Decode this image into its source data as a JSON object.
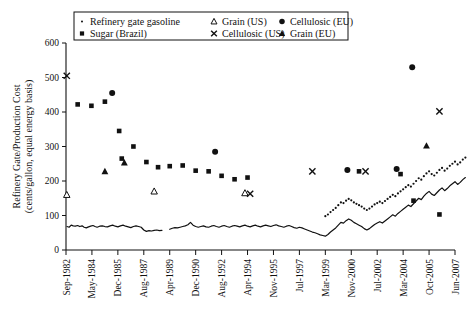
{
  "chart_data": {
    "type": "scatter",
    "title": "",
    "xlabel": "",
    "ylabel": "Refinery Gate/Production Cost (cents/gallon, equal energy basis)",
    "ylabel_line1": "Refinery Gate/Production Cost",
    "ylabel_line2": "(cents/gallon, equal energy basis)",
    "ylim": [
      0,
      600
    ],
    "yticks": [
      0,
      100,
      200,
      300,
      400,
      500,
      600
    ],
    "grid": false,
    "legend_position": "top-center",
    "xticks": [
      "Sep-1982",
      "May-1984",
      "Dec-1985",
      "Aug-1987",
      "Apr-1989",
      "Dec-1990",
      "Aug-1992",
      "Apr-1994",
      "Nov-1995",
      "Jul-1997",
      "Mar-1999",
      "Nov-2000",
      "Jul-2002",
      "Mar-2004",
      "Oct-2005",
      "Jun-2007"
    ],
    "xtick_index": [
      0,
      1,
      2,
      3,
      4,
      5,
      6,
      7,
      8,
      9,
      10,
      11,
      12,
      13,
      14,
      15
    ],
    "series": [
      {
        "name": "Refinery gate gasoline",
        "marker": "dot",
        "style": "line",
        "color": "#111111",
        "points": [
          [
            0.04,
            68
          ],
          [
            0.12,
            66
          ],
          [
            0.2,
            72
          ],
          [
            0.28,
            70
          ],
          [
            0.36,
            69
          ],
          [
            0.45,
            71
          ],
          [
            0.53,
            68
          ],
          [
            0.62,
            70
          ],
          [
            0.7,
            66
          ],
          [
            0.78,
            64
          ],
          [
            0.87,
            67
          ],
          [
            0.95,
            69
          ],
          [
            1.04,
            71
          ],
          [
            1.12,
            68
          ],
          [
            1.2,
            66
          ],
          [
            1.3,
            69
          ],
          [
            1.4,
            70
          ],
          [
            1.5,
            68
          ],
          [
            1.6,
            67
          ],
          [
            1.7,
            70
          ],
          [
            1.8,
            72
          ],
          [
            1.9,
            69
          ],
          [
            2.0,
            67
          ],
          [
            2.1,
            70
          ],
          [
            2.2,
            72
          ],
          [
            2.3,
            69
          ],
          [
            2.4,
            67
          ],
          [
            2.5,
            65
          ],
          [
            2.6,
            68
          ],
          [
            2.7,
            70
          ],
          [
            2.8,
            68
          ],
          [
            2.9,
            66
          ],
          [
            3.0,
            58
          ],
          [
            3.1,
            54
          ],
          [
            3.2,
            56
          ],
          [
            3.3,
            55
          ],
          [
            3.4,
            57
          ],
          [
            3.5,
            58
          ],
          [
            3.6,
            56
          ],
          [
            3.7,
            57
          ],
          [
            4.0,
            60
          ],
          [
            4.1,
            63
          ],
          [
            4.2,
            65
          ],
          [
            4.3,
            64
          ],
          [
            4.4,
            66
          ],
          [
            4.5,
            68
          ],
          [
            4.6,
            70
          ],
          [
            4.7,
            73
          ],
          [
            4.8,
            80
          ],
          [
            4.9,
            72
          ],
          [
            5.0,
            68
          ],
          [
            5.1,
            66
          ],
          [
            5.2,
            68
          ],
          [
            5.3,
            70
          ],
          [
            5.4,
            67
          ],
          [
            5.5,
            66
          ],
          [
            5.6,
            69
          ],
          [
            5.7,
            71
          ],
          [
            5.8,
            68
          ],
          [
            5.9,
            66
          ],
          [
            6.0,
            69
          ],
          [
            6.1,
            71
          ],
          [
            6.2,
            68
          ],
          [
            6.3,
            66
          ],
          [
            6.4,
            69
          ],
          [
            6.5,
            71
          ],
          [
            6.6,
            69
          ],
          [
            6.7,
            67
          ],
          [
            6.8,
            70
          ],
          [
            6.9,
            72
          ],
          [
            7.0,
            69
          ],
          [
            7.1,
            67
          ],
          [
            7.2,
            70
          ],
          [
            7.3,
            72
          ],
          [
            7.4,
            69
          ],
          [
            7.5,
            67
          ],
          [
            7.6,
            70
          ],
          [
            7.7,
            72
          ],
          [
            7.8,
            70
          ],
          [
            7.9,
            68
          ],
          [
            8.0,
            71
          ],
          [
            8.1,
            73
          ],
          [
            8.2,
            70
          ],
          [
            8.3,
            68
          ],
          [
            8.4,
            66
          ],
          [
            8.5,
            69
          ],
          [
            8.6,
            71
          ],
          [
            8.7,
            68
          ],
          [
            8.8,
            65
          ],
          [
            8.9,
            63
          ],
          [
            9.0,
            66
          ],
          [
            9.1,
            64
          ],
          [
            9.2,
            61
          ],
          [
            9.3,
            58
          ],
          [
            9.4,
            55
          ],
          [
            9.5,
            52
          ],
          [
            9.6,
            50
          ],
          [
            9.7,
            47
          ],
          [
            9.8,
            44
          ],
          [
            9.9,
            42
          ],
          [
            10.0,
            40
          ],
          [
            10.1,
            45
          ],
          [
            10.2,
            52
          ],
          [
            10.3,
            58
          ],
          [
            10.4,
            64
          ],
          [
            10.5,
            72
          ],
          [
            10.6,
            80
          ],
          [
            10.7,
            78
          ],
          [
            10.8,
            85
          ],
          [
            10.9,
            90
          ],
          [
            11.0,
            86
          ],
          [
            11.1,
            80
          ],
          [
            11.2,
            76
          ],
          [
            11.3,
            72
          ],
          [
            11.4,
            68
          ],
          [
            11.5,
            62
          ],
          [
            11.6,
            58
          ],
          [
            11.7,
            62
          ],
          [
            11.8,
            68
          ],
          [
            11.9,
            74
          ],
          [
            12.0,
            78
          ],
          [
            12.1,
            82
          ],
          [
            12.2,
            78
          ],
          [
            12.3,
            84
          ],
          [
            12.4,
            90
          ],
          [
            12.5,
            96
          ],
          [
            12.6,
            102
          ],
          [
            12.7,
            98
          ],
          [
            12.8,
            106
          ],
          [
            12.9,
            112
          ],
          [
            13.0,
            118
          ],
          [
            13.1,
            124
          ],
          [
            13.2,
            130
          ],
          [
            13.3,
            126
          ],
          [
            13.4,
            134
          ],
          [
            13.5,
            142
          ],
          [
            13.6,
            150
          ],
          [
            13.7,
            146
          ],
          [
            13.8,
            156
          ],
          [
            13.9,
            164
          ],
          [
            14.0,
            170
          ],
          [
            14.1,
            162
          ],
          [
            14.2,
            158
          ],
          [
            14.3,
            166
          ],
          [
            14.4,
            174
          ],
          [
            14.5,
            180
          ],
          [
            14.6,
            172
          ],
          [
            14.7,
            178
          ],
          [
            14.8,
            186
          ],
          [
            14.9,
            192
          ],
          [
            15.0,
            198
          ],
          [
            15.1,
            190
          ],
          [
            15.2,
            196
          ],
          [
            15.3,
            204
          ],
          [
            15.4,
            210
          ]
        ]
      },
      {
        "name": "Sugar (Brazil)",
        "marker": "square",
        "style": "marker",
        "color": "#111111",
        "points": [
          [
            0.45,
            422
          ],
          [
            0.98,
            418
          ],
          [
            1.5,
            430
          ],
          [
            2.05,
            345
          ],
          [
            2.15,
            265
          ],
          [
            2.6,
            300
          ],
          [
            3.1,
            255
          ],
          [
            3.55,
            240
          ],
          [
            4.0,
            243
          ],
          [
            4.5,
            245
          ],
          [
            5.0,
            230
          ],
          [
            5.5,
            228
          ],
          [
            6.0,
            215
          ],
          [
            6.5,
            205
          ],
          [
            7.0,
            210
          ],
          [
            11.3,
            228
          ],
          [
            12.9,
            220
          ],
          [
            13.4,
            143
          ],
          [
            14.4,
            103
          ]
        ]
      },
      {
        "name": "Grain (US)",
        "marker": "triangle-open",
        "style": "marker",
        "color": "#111111",
        "points": [
          [
            0.03,
            160
          ],
          [
            3.4,
            170
          ],
          [
            6.9,
            165
          ]
        ]
      },
      {
        "name": "Cellulosic (US)",
        "marker": "cross",
        "style": "marker",
        "color": "#111111",
        "points": [
          [
            0.03,
            505
          ],
          [
            7.1,
            163
          ],
          [
            9.5,
            228
          ],
          [
            11.55,
            228
          ],
          [
            14.4,
            402
          ]
        ]
      },
      {
        "name": "Cellulosic (EU)",
        "marker": "circle",
        "style": "marker",
        "color": "#111111",
        "points": [
          [
            1.78,
            455
          ],
          [
            5.75,
            285
          ],
          [
            10.85,
            232
          ],
          [
            12.75,
            235
          ],
          [
            13.35,
            530
          ]
        ]
      },
      {
        "name": "Grain (EU)",
        "marker": "triangle-filled",
        "style": "marker",
        "color": "#111111",
        "points": [
          [
            1.5,
            228
          ],
          [
            2.25,
            253
          ],
          [
            13.9,
            302
          ]
        ]
      }
    ],
    "legend": [
      {
        "label": "Refinery gate gasoline",
        "marker": "dot"
      },
      {
        "label": "Sugar (Brazil)",
        "marker": "square"
      },
      {
        "label": "Grain (US)",
        "marker": "triangle-open"
      },
      {
        "label": "Cellulosic (US)",
        "marker": "cross"
      },
      {
        "label": "Cellulosic (EU)",
        "marker": "circle"
      },
      {
        "label": "Grain (EU)",
        "marker": "triangle-filled"
      }
    ],
    "colors": {
      "ink": "#111111",
      "background": "#ffffff"
    }
  }
}
